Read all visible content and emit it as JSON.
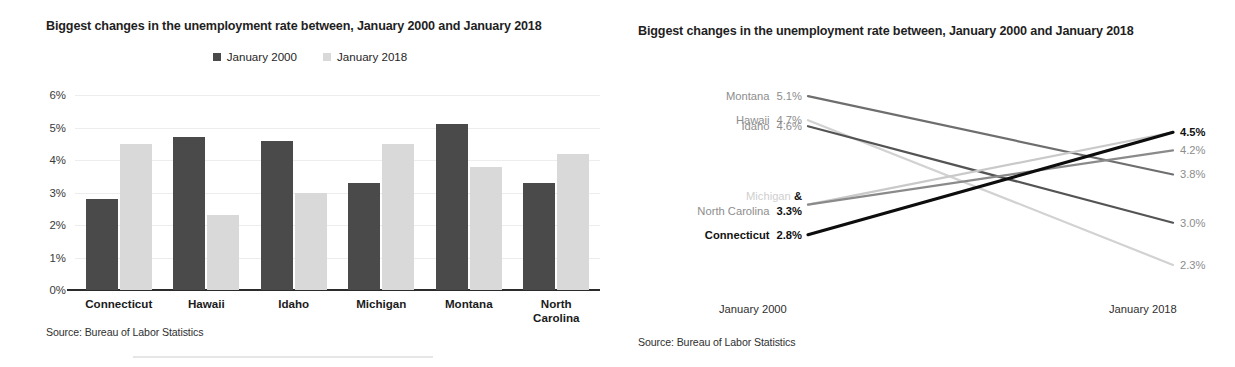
{
  "bar_panel": {
    "title": "Biggest changes in the unemployment rate between, January 2000 and January 2018",
    "source": "Source: Bureau of Labor Statistics",
    "legend": [
      {
        "label": "January 2000",
        "color": "#4a4a4a",
        "icon": "legend-square-icon"
      },
      {
        "label": "January 2018",
        "color": "#d9d9d9",
        "icon": "legend-square-icon"
      }
    ]
  },
  "slope_panel": {
    "title": "Biggest changes in the unemployment rate between, January 2000 and January 2018",
    "source": "Source: Bureau of Labor Statistics",
    "left_axis_caption": "January 2000",
    "right_axis_caption": "January 2018",
    "left_labels": [
      {
        "name": "Montana",
        "value": "5.1%"
      },
      {
        "name": "Hawaii",
        "value": "4.7%"
      },
      {
        "name": "Idaho",
        "value": "4.6%"
      },
      {
        "name_faint": "Michigan",
        "amp": "&",
        "name": "North Carolina",
        "value": "3.3%"
      },
      {
        "name": "Connecticut",
        "value": "2.8%"
      }
    ],
    "right_labels": [
      {
        "value": "4.5%"
      },
      {
        "value": "4.2%"
      },
      {
        "value": "3.8%"
      },
      {
        "value": "3.0%"
      },
      {
        "value": "2.3%"
      }
    ]
  },
  "chart_data": [
    {
      "type": "bar",
      "title": "Biggest changes in the unemployment rate between, January 2000 and January 2018",
      "xlabel": "",
      "ylabel": "",
      "ylim": [
        0,
        6
      ],
      "ytick_labels": [
        "0%",
        "1%",
        "2%",
        "3%",
        "4%",
        "5%",
        "6%"
      ],
      "ytick_values": [
        0,
        1,
        2,
        3,
        4,
        5,
        6
      ],
      "grid": true,
      "legend_position": "top-center",
      "categories": [
        "Connecticut",
        "Hawaii",
        "Idaho",
        "Michigan",
        "Montana",
        "North Carolina"
      ],
      "series": [
        {
          "name": "January 2000",
          "color": "#4a4a4a",
          "values": [
            2.8,
            4.7,
            4.6,
            3.3,
            5.1,
            3.3
          ]
        },
        {
          "name": "January 2018",
          "color": "#d9d9d9",
          "values": [
            4.5,
            2.3,
            3.0,
            4.5,
            3.8,
            4.2
          ]
        }
      ],
      "source": "Source: Bureau of Labor Statistics"
    },
    {
      "type": "line",
      "subtype": "slope",
      "title": "Biggest changes in the unemployment rate between, January 2000 and January 2018",
      "x": [
        "January 2000",
        "January 2018"
      ],
      "ylim": [
        2.0,
        5.4
      ],
      "grid": false,
      "legend_position": "none",
      "series": [
        {
          "name": "Montana",
          "values": [
            5.1,
            3.8
          ],
          "color": "#6e6e6e",
          "emphasis": false
        },
        {
          "name": "Hawaii",
          "values": [
            4.7,
            2.3
          ],
          "color": "#d2d2d2",
          "emphasis": false
        },
        {
          "name": "Idaho",
          "values": [
            4.6,
            3.0
          ],
          "color": "#545454",
          "emphasis": false
        },
        {
          "name": "Michigan",
          "values": [
            3.3,
            4.5
          ],
          "color": "#c9c9c9",
          "emphasis": false
        },
        {
          "name": "North Carolina",
          "values": [
            3.3,
            4.2
          ],
          "color": "#8a8a8a",
          "emphasis": false
        },
        {
          "name": "Connecticut",
          "values": [
            2.8,
            4.5
          ],
          "color": "#0d0d0d",
          "emphasis": true
        }
      ],
      "source": "Source: Bureau of Labor Statistics"
    }
  ]
}
